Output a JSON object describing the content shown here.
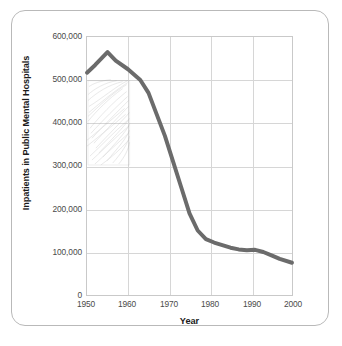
{
  "figure": {
    "frame_color": "#b9b9b9",
    "background": "#ffffff"
  },
  "chart_data": {
    "type": "line",
    "title": "",
    "xlabel": "Year",
    "ylabel": "Inpatients in Public Mental Hospitals",
    "xlim": [
      1950,
      2000
    ],
    "ylim": [
      0,
      600000
    ],
    "grid": true,
    "legend": null,
    "line_color": "#6b6b6b",
    "line_width": 4,
    "x_ticks": [
      1950,
      1960,
      1970,
      1980,
      1990,
      2000
    ],
    "x_tick_labels": [
      "1950",
      "1960",
      "1970",
      "1980",
      "1990",
      "2000"
    ],
    "y_ticks": [
      0,
      100000,
      200000,
      300000,
      400000,
      500000,
      600000
    ],
    "y_tick_labels": [
      "0",
      "100,000",
      "200,000",
      "300,000",
      "400,000",
      "500,000",
      "600,000"
    ],
    "x": [
      1950,
      1952,
      1955,
      1957,
      1960,
      1963,
      1965,
      1967,
      1969,
      1971,
      1973,
      1975,
      1977,
      1979,
      1981,
      1983,
      1985,
      1987,
      1989,
      1991,
      1993,
      1995,
      1997,
      2000
    ],
    "values": [
      517000,
      535000,
      565000,
      545000,
      525000,
      500000,
      470000,
      420000,
      370000,
      310000,
      250000,
      190000,
      150000,
      130000,
      122000,
      116000,
      110000,
      106000,
      104000,
      105000,
      100000,
      92000,
      84000,
      75000
    ],
    "series": [
      {
        "name": "Inpatients in Public Mental Hospitals",
        "values": [
          517000,
          535000,
          565000,
          545000,
          525000,
          500000,
          470000,
          420000,
          370000,
          310000,
          250000,
          190000,
          150000,
          130000,
          122000,
          116000,
          110000,
          106000,
          104000,
          105000,
          100000,
          92000,
          84000,
          75000
        ]
      }
    ],
    "annotations": [
      {
        "name": "pencil-hatching-smudge",
        "description": "Faint gray pencil hatching artifact overlaying the plot",
        "x_range": [
          1950,
          1960
        ],
        "y_range": [
          400000,
          500000
        ]
      }
    ]
  }
}
